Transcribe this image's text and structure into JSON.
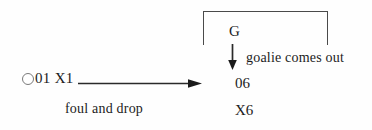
{
  "diagram": {
    "type": "tactics-flow-diagram",
    "background_color": "#fefefe",
    "ink_color": "#1c1c1c",
    "start": {
      "circle_icon": "hollow-circle",
      "circle_color": "#7a7a7a",
      "label": "01 X1"
    },
    "transition": {
      "arrow_icon": "right-arrow",
      "label": "foul and drop"
    },
    "group": {
      "bracket_icon": "top-bracket",
      "bracket_color": "#4a4a4a",
      "goalkeeper_label": "G",
      "action_arrow_icon": "down-arrow",
      "action_label": "goalie comes out",
      "offense_label": "06",
      "defense_label": "X6"
    }
  }
}
